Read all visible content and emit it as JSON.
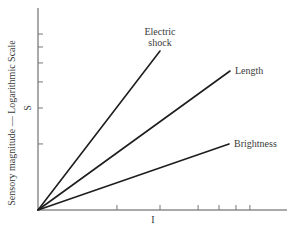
{
  "chart_data": {
    "type": "line",
    "title": "",
    "xlabel": "I",
    "ylabel": "Sensory magnitude — Logarithmic Scale",
    "ylabel_secondary": "S",
    "x_scale": "log (unlabeled ticks)",
    "y_scale": "log (unlabeled ticks)",
    "grid": false,
    "legend": "inline labels at line ends",
    "xlim": [
      0,
      1
    ],
    "ylim": [
      0,
      1
    ],
    "x_ticks_normalized": [
      0.317,
      0.49,
      0.643,
      0.727,
      0.795,
      0.851
    ],
    "y_ticks_normalized": [
      0.327,
      0.505,
      0.634,
      0.728,
      0.807,
      0.871
    ],
    "series": [
      {
        "name": "Electric shock",
        "label_lines": [
          "Electric",
          "shock"
        ],
        "x": [
          0,
          0.49
        ],
        "y": [
          0,
          0.787
        ],
        "slope": 1.3
      },
      {
        "name": "Length",
        "label_lines": [
          "Length"
        ],
        "x": [
          0,
          0.771
        ],
        "y": [
          0,
          0.688
        ],
        "slope": 0.72
      },
      {
        "name": "Brightness",
        "label_lines": [
          "Brightness"
        ],
        "x": [
          0,
          0.767
        ],
        "y": [
          0,
          0.327
        ],
        "slope": 0.35
      }
    ]
  },
  "labels": {
    "y_axis": "Sensory magnitude — Logarithmic Scale",
    "y_axis_symbol": "S",
    "x_axis_symbol": "I",
    "electric_line1": "Electric",
    "electric_line2": "shock",
    "length": "Length",
    "brightness": "Brightness"
  },
  "colors": {
    "line": "#1e1e1e",
    "axis": "#555555",
    "text": "#3a3a3a",
    "background": "#ffffff"
  }
}
